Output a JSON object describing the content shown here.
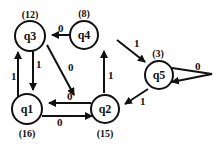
{
  "diagram": {
    "nodes": [
      {
        "id": "q3",
        "label": "q3",
        "count": "(12)"
      },
      {
        "id": "q4",
        "label": "q4",
        "count": "(8)"
      },
      {
        "id": "q5",
        "label": "q5",
        "count": "(3)"
      },
      {
        "id": "q1",
        "label": "q1",
        "count": "(16)"
      },
      {
        "id": "q2",
        "label": "q2",
        "count": "(15)"
      }
    ],
    "edges": [
      {
        "from": "q4",
        "to": "q3",
        "label": "0"
      },
      {
        "from": "q3",
        "to": "q1",
        "label": "1"
      },
      {
        "from": "q1",
        "to": "q3",
        "label": "1"
      },
      {
        "from": "q3",
        "to": "q2",
        "label": "0"
      },
      {
        "from": "q2",
        "to": "q4",
        "label": "1"
      },
      {
        "from": "q4",
        "to": "q5",
        "label": "1"
      },
      {
        "from": "q5",
        "to": "q5",
        "label": "0"
      },
      {
        "from": "q5",
        "to": "q2",
        "label": "1"
      },
      {
        "from": "q2",
        "to": "q1",
        "label": "0"
      },
      {
        "from": "q1",
        "to": "q2",
        "label": "0"
      }
    ]
  }
}
